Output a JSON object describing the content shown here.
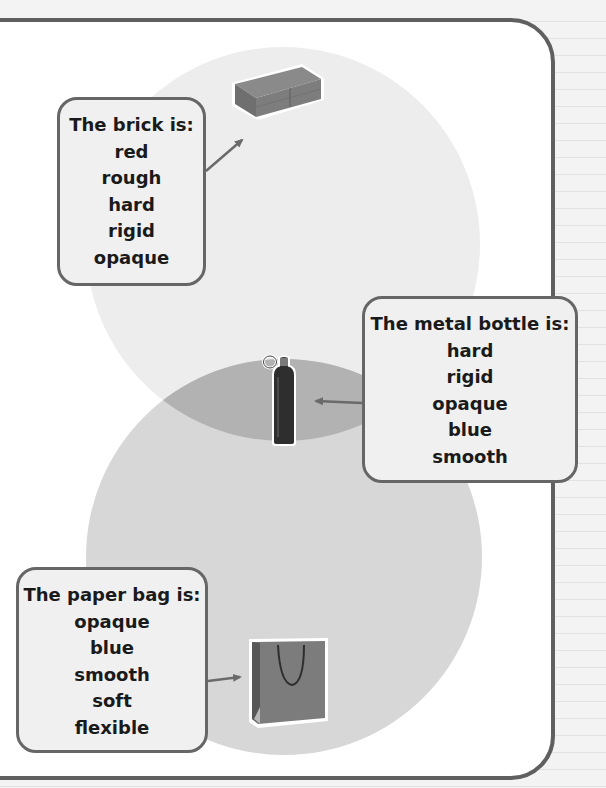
{
  "diagram": {
    "type": "venn",
    "sets": [
      {
        "name": "top-circle",
        "color": "#ededed"
      },
      {
        "name": "bottom-circle",
        "color": "#d7d7d7"
      }
    ],
    "overlap_color": "#b2b2b2",
    "frame_color": "#5f5f5f"
  },
  "cards": {
    "brick": {
      "title": "The brick is:",
      "properties": [
        "red",
        "rough",
        "hard",
        "rigid",
        "opaque"
      ]
    },
    "bottle": {
      "title": "The metal bottle is:",
      "properties": [
        "hard",
        "rigid",
        "opaque",
        "blue",
        "smooth"
      ]
    },
    "bag": {
      "title": "The paper bag is:",
      "properties": [
        "opaque",
        "blue",
        "smooth",
        "soft",
        "flexible"
      ]
    }
  },
  "objects": [
    {
      "name": "brick",
      "icon": "brick-icon",
      "region": "top-circle"
    },
    {
      "name": "metal bottle",
      "icon": "bottle-icon",
      "region": "overlap"
    },
    {
      "name": "paper bag",
      "icon": "paper-bag-icon",
      "region": "bottom-circle"
    }
  ]
}
